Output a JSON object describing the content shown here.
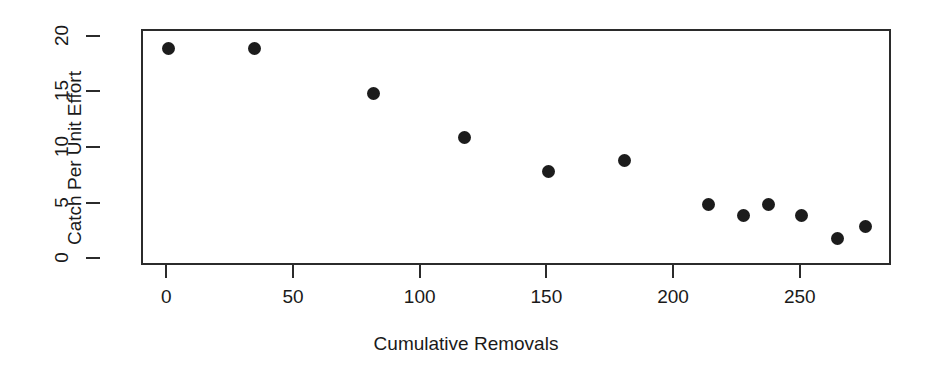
{
  "chart_data": {
    "type": "scatter",
    "title": "",
    "xlabel": "Cumulative Removals",
    "ylabel": "Catch Per Unit Effort",
    "xlim": [
      -10,
      286
    ],
    "ylim": [
      -0.6,
      20.6
    ],
    "xticks": [
      0,
      50,
      100,
      150,
      200,
      250
    ],
    "yticks": [
      0,
      5,
      10,
      15,
      20
    ],
    "xticklabels": [
      "0",
      "50",
      "100",
      "150",
      "200",
      "250"
    ],
    "yticklabels": [
      "0",
      "5",
      "10",
      "15",
      "20"
    ],
    "grid": false,
    "legend": false,
    "marker": "filled-circle",
    "marker_color": "#1c1c1c",
    "x": [
      0,
      34,
      81,
      117,
      150,
      180,
      213,
      227,
      237,
      250,
      264,
      275
    ],
    "y": [
      19,
      19,
      15,
      11,
      8,
      9,
      5,
      4,
      5,
      4,
      2,
      3
    ],
    "points": [
      {
        "x": 0,
        "y": 19
      },
      {
        "x": 34,
        "y": 19
      },
      {
        "x": 81,
        "y": 15
      },
      {
        "x": 117,
        "y": 11
      },
      {
        "x": 150,
        "y": 8
      },
      {
        "x": 180,
        "y": 9
      },
      {
        "x": 213,
        "y": 5
      },
      {
        "x": 227,
        "y": 4
      },
      {
        "x": 237,
        "y": 5
      },
      {
        "x": 250,
        "y": 4
      },
      {
        "x": 264,
        "y": 2
      },
      {
        "x": 275,
        "y": 3
      }
    ]
  },
  "style": {
    "background": "#ffffff",
    "axis_color": "#2b2b2b",
    "text_color": "#1a1a1a",
    "point_color": "#1c1c1c"
  }
}
